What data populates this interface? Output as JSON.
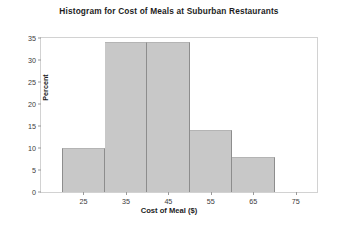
{
  "chart_data": {
    "type": "bar",
    "title": "Histogram for Cost of Meals at Suburban Restaurants",
    "xlabel": "Cost of Meal ($)",
    "ylabel": "Percent",
    "xlim": [
      15,
      80
    ],
    "ylim": [
      0,
      35
    ],
    "grid": false,
    "legend": null,
    "bin_width": 10,
    "bin_edges": [
      20,
      30,
      40,
      50,
      60,
      70
    ],
    "categories": [
      "20-30",
      "30-40",
      "40-50",
      "50-60",
      "60-70"
    ],
    "values": [
      10,
      34,
      34,
      14,
      8
    ],
    "bars": [
      {
        "label": "20-30",
        "start": 20,
        "end": 30,
        "value": 10
      },
      {
        "label": "30-40",
        "start": 30,
        "end": 40,
        "value": 34
      },
      {
        "label": "40-50",
        "start": 40,
        "end": 50,
        "value": 34
      },
      {
        "label": "50-60",
        "start": 50,
        "end": 60,
        "value": 14
      },
      {
        "label": "60-70",
        "start": 60,
        "end": 70,
        "value": 8
      }
    ],
    "yticks": [
      0,
      5,
      10,
      15,
      20,
      25,
      30,
      35
    ],
    "ytick_labels": [
      "0",
      "5",
      "10",
      "15",
      "20",
      "25",
      "30",
      "35"
    ],
    "xticks": [
      25,
      35,
      45,
      55,
      65,
      75
    ],
    "xtick_labels": [
      "25",
      "35",
      "45",
      "55",
      "65",
      "75"
    ],
    "colors": {
      "bar_fill": "#c8c8c8",
      "bar_edge": "#8d8d8d",
      "frame": "#d2d2d2",
      "text": "#1d1d1d",
      "tick_text": "#3a3a3a",
      "background": "#ffffff"
    }
  }
}
